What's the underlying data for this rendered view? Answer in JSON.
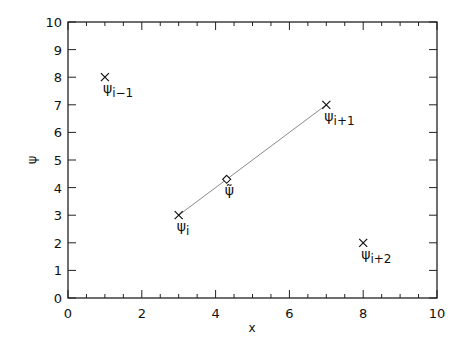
{
  "chart_data": {
    "type": "scatter",
    "title": "",
    "xlabel": "x",
    "ylabel": "ψ",
    "xlim": [
      0,
      10
    ],
    "ylim": [
      0,
      10
    ],
    "grid": false,
    "legend": null,
    "x_ticks": [
      0,
      2,
      4,
      6,
      8,
      10
    ],
    "x_tick_labels": [
      "0",
      "2",
      "4",
      "6",
      "8",
      "10"
    ],
    "x_minor_step": 0.5,
    "y_ticks": [
      0,
      1,
      2,
      3,
      4,
      5,
      6,
      7,
      8,
      9,
      10
    ],
    "y_tick_labels": [
      "0",
      "1",
      "2",
      "3",
      "4",
      "5",
      "6",
      "7",
      "8",
      "9",
      "10"
    ],
    "series": [
      {
        "name": "points",
        "marker": "x",
        "points": [
          {
            "x": 1,
            "y": 8,
            "label": "ψ",
            "sub": "i−1"
          },
          {
            "x": 3,
            "y": 3,
            "label": "ψ",
            "sub": "i"
          },
          {
            "x": 7,
            "y": 7,
            "label": "ψ",
            "sub": "i+1"
          },
          {
            "x": 8,
            "y": 2,
            "label": "ψ",
            "sub": "i+2"
          }
        ]
      },
      {
        "name": "interpolation-line",
        "marker": "none",
        "line_color": "#8a8a8a",
        "points": [
          {
            "x": 3,
            "y": 3
          },
          {
            "x": 7,
            "y": 7
          }
        ]
      },
      {
        "name": "interpolated-point",
        "marker": "diamond",
        "points": [
          {
            "x": 4.3,
            "y": 4.3,
            "label": "ψ̃",
            "sub": ""
          }
        ]
      }
    ]
  }
}
